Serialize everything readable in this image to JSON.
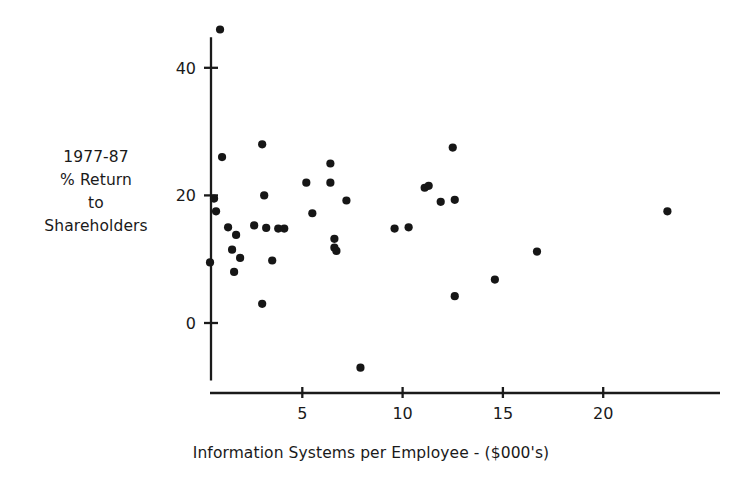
{
  "figure": {
    "background_color": "#ffffff",
    "ink_color": "#1a1a1a",
    "point_color": "#161616"
  },
  "y_axis_caption": {
    "line1": "1977-87",
    "line2": "% Return",
    "line3": "to",
    "line4": "Shareholders"
  },
  "x_axis_caption": "Information Systems per Employee - ($000's)",
  "chart_data": {
    "type": "scatter",
    "title": "",
    "xlabel": "Information Systems per Employee - ($000's)",
    "ylabel": "1977-87 % Return to Shareholders",
    "grid": false,
    "legend": null,
    "xlim": [
      0,
      26.5
    ],
    "ylim": [
      -10,
      48
    ],
    "xticks": [
      5,
      10,
      15,
      20
    ],
    "xtick_labels": [
      "5",
      "10",
      "15",
      "20"
    ],
    "yticks": [
      0,
      20,
      40
    ],
    "ytick_labels": [
      "0",
      "20",
      "40"
    ],
    "series": [
      {
        "name": "Companies",
        "marker": "circle",
        "marker_size": 5,
        "points": [
          {
            "x": 0.9,
            "y": 46.0
          },
          {
            "x": 1.0,
            "y": 26.0
          },
          {
            "x": 0.6,
            "y": 19.5
          },
          {
            "x": 0.7,
            "y": 17.5
          },
          {
            "x": 0.4,
            "y": 9.5
          },
          {
            "x": 1.3,
            "y": 15.0
          },
          {
            "x": 1.7,
            "y": 13.8
          },
          {
            "x": 1.5,
            "y": 11.5
          },
          {
            "x": 1.9,
            "y": 10.2
          },
          {
            "x": 1.6,
            "y": 8.0
          },
          {
            "x": 3.0,
            "y": 28.0
          },
          {
            "x": 2.6,
            "y": 15.3
          },
          {
            "x": 3.1,
            "y": 20.0
          },
          {
            "x": 3.2,
            "y": 14.9
          },
          {
            "x": 3.8,
            "y": 14.8
          },
          {
            "x": 4.1,
            "y": 14.8
          },
          {
            "x": 3.5,
            "y": 9.8
          },
          {
            "x": 3.0,
            "y": 3.0
          },
          {
            "x": 5.2,
            "y": 22.0
          },
          {
            "x": 5.5,
            "y": 17.2
          },
          {
            "x": 6.4,
            "y": 25.0
          },
          {
            "x": 6.4,
            "y": 22.0
          },
          {
            "x": 6.6,
            "y": 13.2
          },
          {
            "x": 6.6,
            "y": 11.8
          },
          {
            "x": 6.7,
            "y": 11.3
          },
          {
            "x": 7.2,
            "y": 19.2
          },
          {
            "x": 7.9,
            "y": -7.0
          },
          {
            "x": 9.6,
            "y": 14.8
          },
          {
            "x": 10.3,
            "y": 15.0
          },
          {
            "x": 11.1,
            "y": 21.2
          },
          {
            "x": 11.3,
            "y": 21.5
          },
          {
            "x": 11.9,
            "y": 19.0
          },
          {
            "x": 12.5,
            "y": 27.5
          },
          {
            "x": 12.6,
            "y": 19.3
          },
          {
            "x": 12.6,
            "y": 4.2
          },
          {
            "x": 14.6,
            "y": 6.8
          },
          {
            "x": 16.7,
            "y": 11.2
          },
          {
            "x": 23.2,
            "y": 17.5
          }
        ]
      }
    ]
  }
}
